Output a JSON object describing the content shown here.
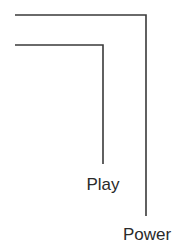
{
  "diagram": {
    "type": "callout-leader-lines",
    "line_color": "#3a3a3a",
    "background": "#ffffff",
    "callouts": [
      {
        "label": "Power",
        "points": [
          [
            15,
            15
          ],
          [
            146,
            15
          ],
          [
            146,
            216
          ]
        ],
        "label_x": 147,
        "label_y": 226
      },
      {
        "label": "Play",
        "points": [
          [
            15,
            45
          ],
          [
            103,
            45
          ],
          [
            103,
            164
          ]
        ],
        "label_x": 103,
        "label_y": 176
      }
    ]
  }
}
